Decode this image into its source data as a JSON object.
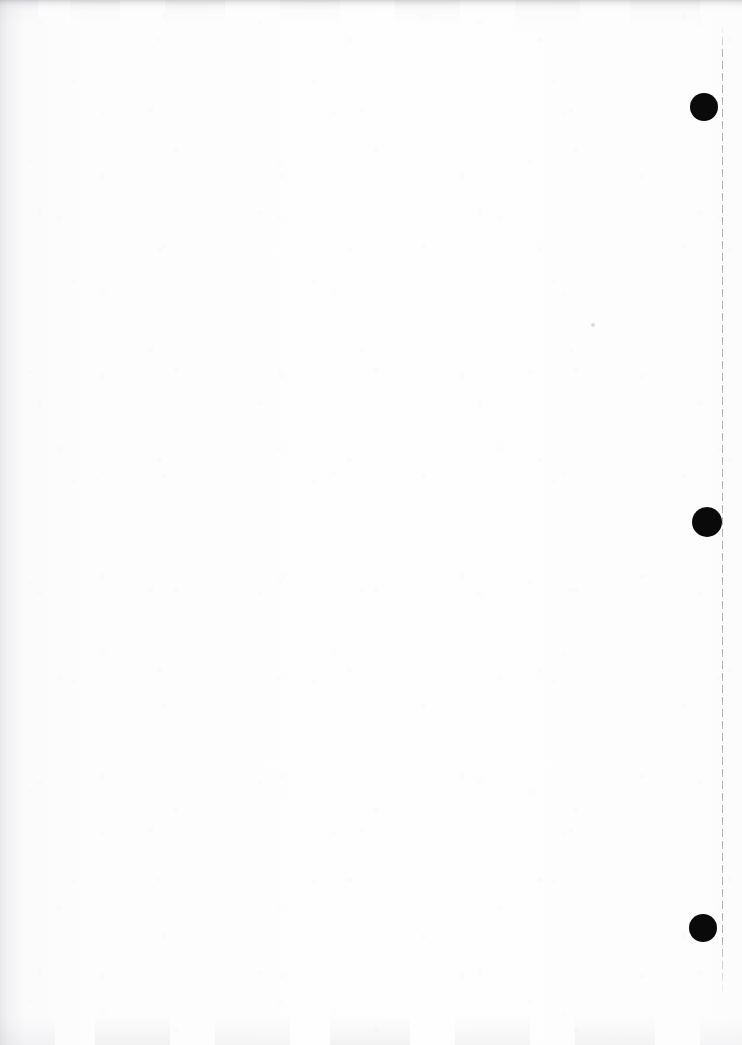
{
  "page": {
    "kind": "scanned-document-page",
    "content_description": "Blank scanned page",
    "width": 742,
    "height": 1045,
    "paper_color": "#fdfdfd",
    "ink_color": "#0a0a0a",
    "rule_color": "#b0b0b8",
    "body_text": ""
  },
  "margin_rule": {
    "name": "right-margin-dashed-rule",
    "orientation": "vertical",
    "x": 722,
    "y_start": 25,
    "y_end": 1000,
    "dash_length": 8,
    "gap_length": 4,
    "color": "#b0b0b8"
  },
  "register_marks": [
    {
      "label": "top-register-mark",
      "cx": 704,
      "cy": 107,
      "r": 14,
      "color": "#0a0a0a"
    },
    {
      "label": "middle-register-mark",
      "cx": 707,
      "cy": 522,
      "r": 15,
      "color": "#0a0a0a"
    },
    {
      "label": "bottom-register-mark",
      "cx": 703,
      "cy": 928,
      "r": 14,
      "color": "#0a0a0a"
    }
  ],
  "artifacts": {
    "top_edge_band": {
      "label": "top-edge-scan-band",
      "height": 10,
      "color": "#787880"
    },
    "bottom_edge_band": {
      "label": "bottom-edge-scan-band",
      "height": 30,
      "color": "#a5a5ad"
    },
    "left_edge_band": {
      "label": "left-edge-scan-band",
      "width": 26,
      "color": "#9696a0"
    },
    "speck": {
      "label": "stray-speck",
      "cx": 593,
      "cy": 325,
      "r": 2,
      "color": "#8c8c96"
    }
  }
}
